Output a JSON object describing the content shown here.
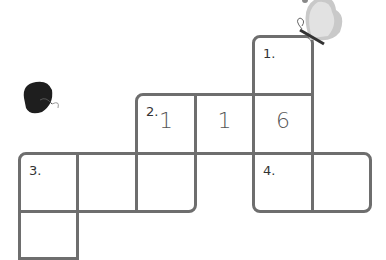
{
  "puzzle": {
    "cells": [
      {
        "id": "c1",
        "x": 252,
        "y": 35,
        "w": 62,
        "h": 61,
        "number": "1.",
        "value": "",
        "r": "tl tr"
      },
      {
        "id": "c2a",
        "x": 135,
        "y": 93,
        "w": 62,
        "h": 62,
        "number": "2.",
        "value": "1",
        "r": "tl"
      },
      {
        "id": "c2b",
        "x": 194,
        "y": 93,
        "w": 61,
        "h": 62,
        "number": "",
        "value": "1",
        "r": ""
      },
      {
        "id": "c2c",
        "x": 252,
        "y": 93,
        "w": 62,
        "h": 62,
        "number": "",
        "value": "6",
        "r": ""
      },
      {
        "id": "c3a",
        "x": 18,
        "y": 152,
        "w": 61,
        "h": 61,
        "number": "3.",
        "value": "",
        "r": "tl"
      },
      {
        "id": "c3b",
        "x": 76,
        "y": 152,
        "w": 62,
        "h": 61,
        "number": "",
        "value": "",
        "r": ""
      },
      {
        "id": "c3c",
        "x": 135,
        "y": 152,
        "w": 62,
        "h": 61,
        "number": "",
        "value": "",
        "r": "br"
      },
      {
        "id": "c4a",
        "x": 252,
        "y": 152,
        "w": 62,
        "h": 61,
        "number": "4.",
        "value": "",
        "r": "bl"
      },
      {
        "id": "c4b",
        "x": 311,
        "y": 152,
        "w": 61,
        "h": 61,
        "number": "",
        "value": "",
        "r": "tr br"
      },
      {
        "id": "c3d",
        "x": 18,
        "y": 210,
        "w": 61,
        "h": 50,
        "number": "",
        "value": "",
        "r": ""
      }
    ]
  },
  "decorations": {
    "butterfly_gray": "butterfly-icon",
    "butterfly_black": "butterfly-icon"
  },
  "colors": {
    "grid": "#6e6e6e",
    "text": "#333333"
  }
}
